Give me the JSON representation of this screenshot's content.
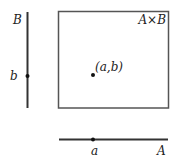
{
  "diagram": {
    "vertical_axis": {
      "name_label": "B",
      "point_label": "b"
    },
    "horizontal_axis": {
      "name_label": "A",
      "point_label": "a"
    },
    "product_set": {
      "label": "A×B",
      "point_label": "(a,b)"
    }
  },
  "colors": {
    "axis": "#333333",
    "box_border": "#555555",
    "point": "#111111",
    "text": "#222222"
  }
}
